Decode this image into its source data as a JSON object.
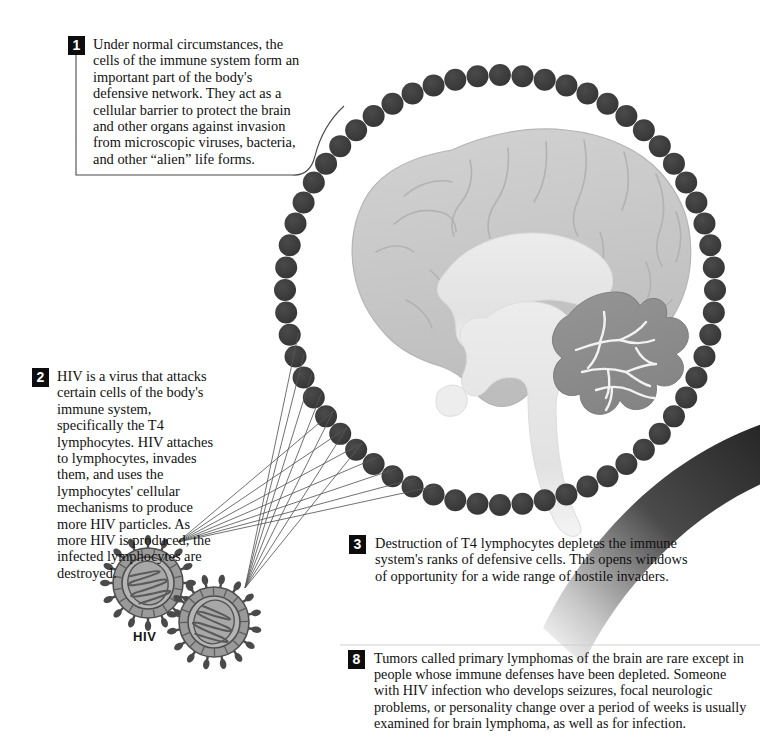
{
  "figure": {
    "background_color": "#ffffff"
  },
  "callouts": [
    {
      "id": "callout-1",
      "number": "1",
      "text": "Under normal circumstances, the cells of the immune system form an important part of the body's defensive network. They act as a cellular barrier to protect the brain and other organs against invasion from microscopic viruses, bacteria, and other “alien” life forms."
    },
    {
      "id": "callout-2",
      "number": "2",
      "text": "HIV is a virus that attacks certain cells of the body's immune system, specifically the T4 lymphocytes. HIV attaches to lymphocytes, invades them, and uses the lymphocytes' cellular mechanisms to produce more HIV particles. As more HIV is produced, the infected lymphocytes are destroyed."
    },
    {
      "id": "callout-3",
      "number": "3",
      "text": "Destruction of T4 lymphocytes depletes the immune system's ranks of defensive cells. This opens windows of opportunity for a wide range of hostile invaders."
    },
    {
      "id": "callout-8",
      "number": "8",
      "text": "Tumors called primary lymphomas of the brain are rare except in people whose immune defenses have been depleted. Someone with HIV infection who develops seizures, focal neurologic problems, or personality change over a period of weeks is usually examined for brain lymphoma, as well as for infection."
    }
  ],
  "labels": {
    "hiv": "HIV"
  },
  "illustration": {
    "brain": {
      "name": "sagittal-brain-cross-section",
      "parts": [
        "cerebrum",
        "corpus-callosum",
        "brainstem",
        "cerebellum"
      ],
      "cerebrum_color": "#c9c9c9",
      "inner_color": "#eaeaea",
      "cerebellum_color": "#8f8f8f",
      "outline_color": "#b0b0b0"
    },
    "immune_ring": {
      "name": "immune-cell-barrier-ring",
      "cell_count": 60,
      "cell_color": "#3a3a3a",
      "center_x": 500,
      "center_y": 290,
      "radius": 215,
      "cell_radius": 11
    },
    "virus_particles": [
      {
        "name": "hiv-particle-left",
        "cx": 148,
        "cy": 583,
        "r": 35
      },
      {
        "name": "hiv-particle-right",
        "cx": 214,
        "cy": 622,
        "r": 35
      }
    ],
    "virus_colors": {
      "envelope": "#9a9a9a",
      "capsid": "#b5b5b5",
      "spike": "#4a4a4a",
      "rna": "#5a5a5a"
    },
    "swoosh": {
      "name": "decorative-swoosh-arc",
      "color_dark": "#2b2b2b",
      "color_fade": "#ffffff"
    },
    "leader_lines": {
      "name": "virus-attack-leader-lines",
      "fan_count": 2,
      "color": "#555555"
    }
  }
}
